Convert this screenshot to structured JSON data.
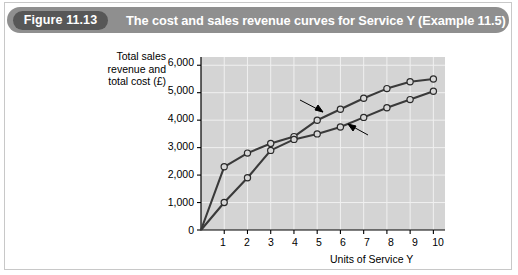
{
  "figure": {
    "badge": "Figure 11.13",
    "title": "The cost and sales revenue curves for Service Y (Example 11.5)",
    "badge_color": "#575757",
    "header_color": "#8f8f8f",
    "plot_background": "#d4d4d4"
  },
  "chart_data": {
    "type": "line",
    "title": "The cost and sales revenue curves for Service Y (Example 11.5)",
    "xlabel": "Units of Service Y",
    "ylabel": "Total sales revenue and total cost (£)",
    "xlim": [
      0,
      10.5
    ],
    "ylim": [
      0,
      6300
    ],
    "grid": true,
    "legend": "annotations",
    "x": [
      0,
      1,
      2,
      3,
      4,
      5,
      6,
      7,
      8,
      9,
      10
    ],
    "xticklabels": [
      "1",
      "2",
      "3",
      "4",
      "5",
      "6",
      "7",
      "8",
      "9",
      "10"
    ],
    "xtickvalues": [
      1,
      2,
      3,
      4,
      5,
      6,
      7,
      8,
      9,
      10
    ],
    "yticklabels": [
      "0",
      "1,000",
      "2,000",
      "3,000",
      "4,000",
      "5,000",
      "6,000"
    ],
    "ytickvalues": [
      0,
      1000,
      2000,
      3000,
      4000,
      5000,
      6000
    ],
    "series": [
      {
        "name": "Total sales revenue",
        "values": [
          0,
          2300,
          2800,
          3150,
          3400,
          4000,
          4400,
          4800,
          5150,
          5400,
          5500
        ],
        "marker": "circle",
        "color": "#3a3a3a"
      },
      {
        "name": "Total cost",
        "values": [
          0,
          1000,
          1900,
          2900,
          3300,
          3500,
          3750,
          4100,
          4450,
          4750,
          5050
        ],
        "marker": "circle",
        "color": "#3a3a3a"
      }
    ],
    "annotations": [
      {
        "text_line1": "Total sales",
        "text_line2": "revenue",
        "target_series": "Total sales revenue"
      },
      {
        "text_line1": "Total cost",
        "text_line2": "",
        "target_series": "Total cost"
      }
    ]
  }
}
